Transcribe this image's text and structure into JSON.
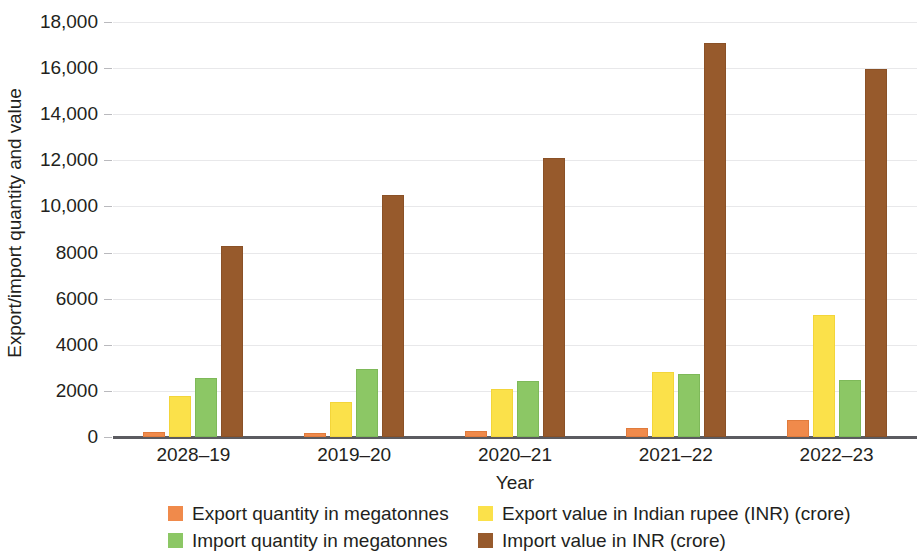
{
  "chart_data": {
    "type": "bar",
    "title": "",
    "xlabel": "Year",
    "ylabel": "Export/import quantity and value",
    "categories": [
      "2028–19",
      "2019–20",
      "2020–21",
      "2021–22",
      "2022–23"
    ],
    "ylim": [
      0,
      18000
    ],
    "yticks": [
      0,
      2000,
      4000,
      6000,
      8000,
      10000,
      12000,
      14000,
      16000,
      18000
    ],
    "ytick_labels": [
      "0",
      "2000",
      "4000",
      "6000",
      "8000",
      "10,000",
      "12,000",
      "14,000",
      "16,000",
      "18,000"
    ],
    "grid": true,
    "legend_position": "bottom",
    "series": [
      {
        "name": "Export quantity in megatonnes",
        "color": "#f08a4b",
        "values": [
          200,
          180,
          240,
          380,
          750
        ]
      },
      {
        "name": "Export value in Indian rupee (INR) (crore)",
        "color": "#fbe14a",
        "values": [
          1800,
          1530,
          2100,
          2830,
          5300
        ]
      },
      {
        "name": "Import quantity in megatonnes",
        "color": "#8cc765",
        "values": [
          2550,
          2950,
          2450,
          2750,
          2480
        ]
      },
      {
        "name": "Import value in INR (crore)",
        "color": "#975a2c",
        "values": [
          8300,
          10500,
          12100,
          17100,
          15950
        ]
      }
    ]
  },
  "axes": {
    "y_title": "Export/import quantity and value",
    "x_title": "Year"
  }
}
